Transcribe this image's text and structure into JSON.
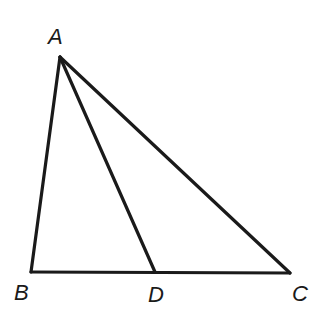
{
  "diagram": {
    "type": "triangle-with-cevian",
    "stroke_color": "#1a1a1a",
    "background": "#ffffff",
    "points": {
      "A": {
        "label": "A",
        "x": 60,
        "y": 57
      },
      "B": {
        "label": "B",
        "x": 31,
        "y": 272
      },
      "C": {
        "label": "C",
        "x": 290,
        "y": 273
      },
      "D": {
        "label": "D",
        "x": 155,
        "y": 272
      }
    },
    "segments": [
      "AB",
      "AC",
      "BC",
      "AD"
    ],
    "labels": {
      "A": "A",
      "B": "B",
      "C": "C",
      "D": "D"
    }
  }
}
